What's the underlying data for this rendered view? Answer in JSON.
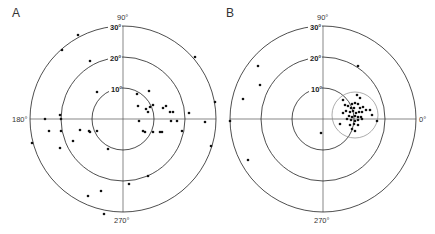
{
  "panels": [
    {
      "letter": "A",
      "center": [
        123,
        119
      ],
      "ring_labels": [
        "10°",
        "20°",
        "30°"
      ],
      "angle_labels": {
        "top": "90°",
        "left": "180°",
        "bottom": "270°"
      },
      "points_px": [
        [
          78,
          35
        ],
        [
          62,
          50
        ],
        [
          195,
          57
        ],
        [
          215,
          102
        ],
        [
          60,
          115
        ],
        [
          90,
          61
        ],
        [
          97,
          92
        ],
        [
          137,
          94
        ],
        [
          149,
          91
        ],
        [
          138,
          106
        ],
        [
          150,
          107
        ],
        [
          153,
          105
        ],
        [
          146,
          109
        ],
        [
          148,
          112
        ],
        [
          163,
          108
        ],
        [
          166,
          106
        ],
        [
          170,
          112
        ],
        [
          173,
          112
        ],
        [
          189,
          113
        ],
        [
          45,
          119
        ],
        [
          61,
          119
        ],
        [
          139,
          121
        ],
        [
          171,
          121
        ],
        [
          177,
          121
        ],
        [
          205,
          122
        ],
        [
          49,
          131
        ],
        [
          61,
          131
        ],
        [
          80,
          130
        ],
        [
          89,
          131
        ],
        [
          90,
          132
        ],
        [
          97,
          131
        ],
        [
          143,
          131
        ],
        [
          145,
          132
        ],
        [
          153,
          132
        ],
        [
          160,
          132
        ],
        [
          162,
          132
        ],
        [
          182,
          131
        ],
        [
          32,
          143
        ],
        [
          73,
          141
        ],
        [
          60,
          148
        ],
        [
          211,
          146
        ],
        [
          108,
          149
        ],
        [
          148,
          176
        ],
        [
          129,
          184
        ],
        [
          101,
          191
        ],
        [
          88,
          196
        ],
        [
          104,
          214
        ]
      ]
    },
    {
      "letter": "B",
      "center": [
        323,
        119
      ],
      "ring_labels": [
        "10°",
        "20°",
        "30°"
      ],
      "angle_labels": {
        "top": "90°",
        "right": "0°",
        "bottom": "270°"
      },
      "confidence_circle": {
        "center": [
          355,
          115
        ],
        "r": 23
      },
      "points_px": [
        [
          258,
          66
        ],
        [
          260,
          85
        ],
        [
          243,
          99
        ],
        [
          230,
          121
        ],
        [
          248,
          160
        ],
        [
          321,
          133
        ],
        [
          358,
          66
        ],
        [
          343,
          113
        ],
        [
          345,
          105
        ],
        [
          357,
          95
        ],
        [
          360,
          98
        ],
        [
          343,
          100
        ],
        [
          352,
          104
        ],
        [
          355,
          103
        ],
        [
          358,
          104
        ],
        [
          348,
          106
        ],
        [
          351,
          108
        ],
        [
          354,
          108
        ],
        [
          360,
          108
        ],
        [
          363,
          107
        ],
        [
          366,
          110
        ],
        [
          346,
          111
        ],
        [
          350,
          112
        ],
        [
          353,
          111
        ],
        [
          356,
          113
        ],
        [
          359,
          112
        ],
        [
          362,
          112
        ],
        [
          370,
          110
        ],
        [
          349,
          116
        ],
        [
          352,
          117
        ],
        [
          355,
          116
        ],
        [
          358,
          117
        ],
        [
          361,
          117
        ],
        [
          372,
          115
        ],
        [
          347,
          119
        ],
        [
          351,
          120
        ],
        [
          355,
          121
        ],
        [
          358,
          120
        ],
        [
          362,
          119
        ],
        [
          377,
          121
        ],
        [
          340,
          124
        ],
        [
          350,
          125
        ],
        [
          354,
          124
        ],
        [
          358,
          125
        ],
        [
          352,
          129
        ],
        [
          355,
          131
        ]
      ]
    }
  ],
  "chart_data": {
    "type": "scatter",
    "subtype": "polar-stereonet",
    "title": "",
    "radial_ticks": [
      "10°",
      "20°",
      "30°"
    ],
    "angular_ticks": [
      "0°",
      "90°",
      "180°",
      "270°"
    ],
    "panels": [
      "A",
      "B"
    ]
  }
}
